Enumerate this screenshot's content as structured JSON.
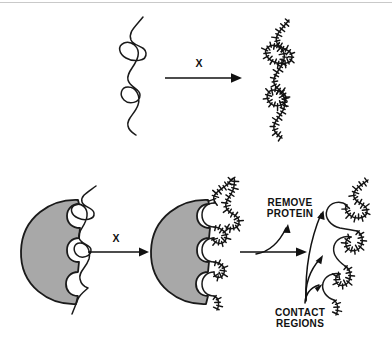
{
  "figure": {
    "width": 392,
    "height": 339,
    "background_color": "#ffffff",
    "ink_color": "#1a1a1a",
    "protein_fill_color": "#a8a8a8",
    "protein_outline_color": "#1a1a1a"
  },
  "panels": {
    "top": {
      "name": "naked-dna-modification",
      "left_strand_label": "unmodified DNA strand",
      "right_strand_label": "fully modified DNA strand",
      "arrow": {
        "label": "X",
        "direction": "right"
      }
    },
    "bottom": {
      "name": "protein-bound-dna-modification",
      "left_complex_label": "protein bound to unmodified DNA",
      "middle_complex_label": "protein bound to modified DNA",
      "right_strand_label": "modified DNA with protected gaps",
      "arrow_one": {
        "label": "X",
        "direction": "right"
      },
      "arrow_two": {
        "label": "REMOVE PROTEIN",
        "label_line_1": "REMOVE",
        "label_line_2": "PROTEIN",
        "direction": "right"
      },
      "callout": {
        "label": "CONTACT REGIONS",
        "label_line_1": "CONTACT",
        "label_line_2": "REGIONS",
        "pointer_count": 3
      }
    }
  },
  "geometry": {
    "top_rule_y": 2,
    "top_arrow": {
      "x1": 165,
      "x2": 237,
      "y": 78
    },
    "top_arrow_label_pos": {
      "x": 199,
      "y": 64
    },
    "bottom_arrow_1": {
      "x1": 88,
      "x2": 148,
      "y": 252
    },
    "bottom_arrow_1_label_pos": {
      "x": 116,
      "y": 239
    },
    "bottom_arrow_2": {
      "x1": 240,
      "x2": 307,
      "y": 252
    },
    "remove_protein_label_pos": {
      "x": 290,
      "y": 209
    },
    "contact_regions_label_pos": {
      "x": 300,
      "y": 314
    },
    "protein_left_center": {
      "x": 52,
      "y": 251
    },
    "protein_mid_center": {
      "x": 182,
      "y": 251
    }
  },
  "chart_data": {
    "type": "diagram",
    "steps": [
      {
        "index": 1,
        "row": "top",
        "description": "Free DNA strand treated with reagent X becomes modified along its entire length",
        "reagent": "X",
        "modified_fraction": 1.0,
        "protected_regions": 0
      },
      {
        "index": 2,
        "row": "bottom",
        "description": "DNA bound to protein treated with reagent X; only exposed DNA is modified",
        "reagent": "X",
        "modified_fraction": 0.62,
        "protected_regions": 3
      },
      {
        "index": 3,
        "row": "bottom",
        "description": "Protein removed, revealing unmodified contact regions as smooth gaps",
        "reagent": null,
        "modified_fraction": 0.62,
        "protected_regions": 3
      }
    ],
    "annotations": [
      "X",
      "X",
      "REMOVE PROTEIN",
      "CONTACT REGIONS"
    ]
  }
}
